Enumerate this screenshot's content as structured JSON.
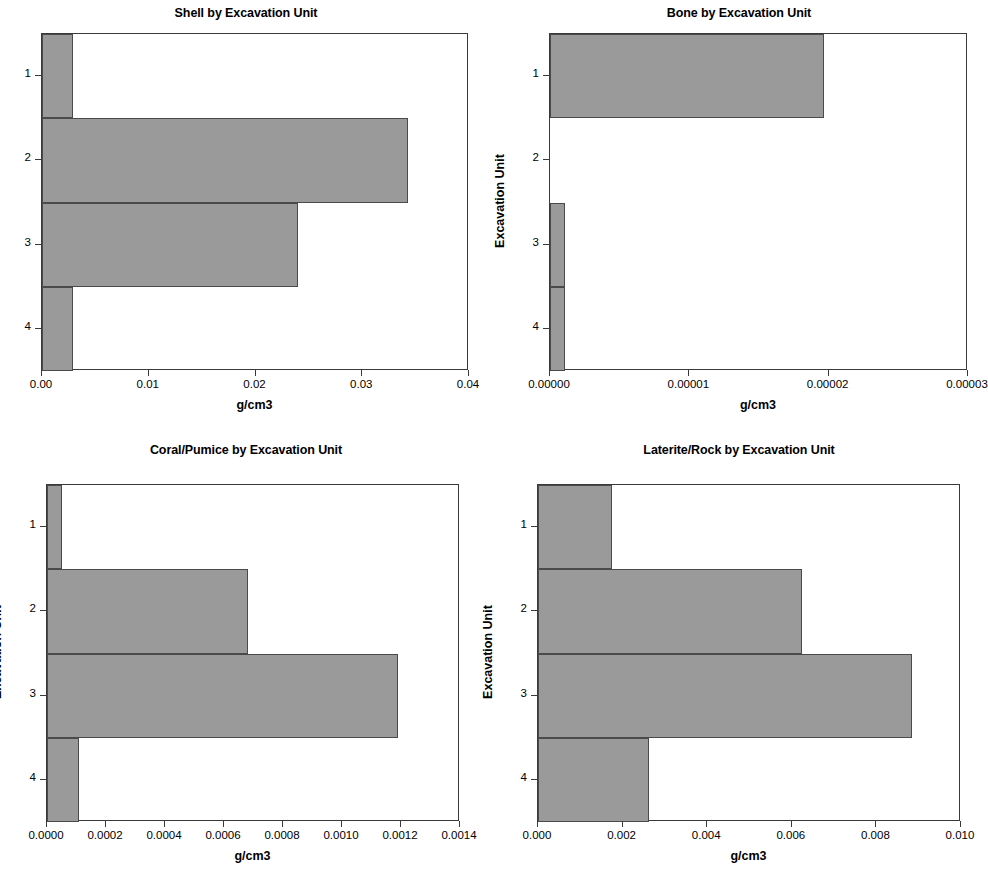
{
  "figure": {
    "background_color": "#ffffff",
    "bar_fill_color": "#9a9a9a",
    "bar_edge_color": "#4a4a4a",
    "axis_color": "#3a3a3a",
    "panel_count": 4
  },
  "chart_data": [
    {
      "type": "bar",
      "orientation": "horizontal",
      "title": "Shell by Excavation Unit",
      "xlabel": "g/cm3",
      "ylabel": "Excavation Unit",
      "categories": [
        "1",
        "2",
        "3",
        "4"
      ],
      "values": [
        0.0029,
        0.0343,
        0.024,
        0.0029
      ],
      "xlim": [
        0.0,
        0.04
      ],
      "xticks": [
        0.0,
        0.01,
        0.02,
        0.03,
        0.04
      ],
      "xticklabels": [
        "0.00",
        "0.01",
        "0.02",
        "0.03",
        "0.04"
      ],
      "grid": false,
      "legend": false
    },
    {
      "type": "bar",
      "orientation": "horizontal",
      "title": "Bone by Excavation Unit",
      "xlabel": "g/cm3",
      "ylabel": "Excavation Unit",
      "categories": [
        "1",
        "2",
        "3",
        "4"
      ],
      "values": [
        1.965e-05,
        0.0,
        1.05e-06,
        1.05e-06
      ],
      "xlim": [
        0.0,
        3e-05
      ],
      "xticks": [
        0.0,
        1e-05,
        2e-05,
        3e-05
      ],
      "xticklabels": [
        "0.00000",
        "0.00001",
        "0.00002",
        "0.00003"
      ],
      "grid": false,
      "legend": false
    },
    {
      "type": "bar",
      "orientation": "horizontal",
      "title": "Coral/Pumice by Excavation Unit",
      "xlabel": "g/cm3",
      "ylabel": "Excavation Unit",
      "categories": [
        "1",
        "2",
        "3",
        "4"
      ],
      "values": [
        5e-05,
        0.00068,
        0.00119,
        0.00011
      ],
      "xlim": [
        0.0,
        0.0014
      ],
      "xticks": [
        0.0,
        0.0002,
        0.0004,
        0.0006,
        0.0008,
        0.001,
        0.0012,
        0.0014
      ],
      "xticklabels": [
        "0.0000",
        "0.0002",
        "0.0004",
        "0.0006",
        "0.0008",
        "0.0010",
        "0.0012",
        "0.0014"
      ],
      "grid": false,
      "legend": false
    },
    {
      "type": "bar",
      "orientation": "horizontal",
      "title": "Laterite/Rock by Excavation Unit",
      "xlabel": "g/cm3",
      "ylabel": "Excavation Unit",
      "categories": [
        "1",
        "2",
        "3",
        "4"
      ],
      "values": [
        0.00175,
        0.00624,
        0.00885,
        0.00263
      ],
      "xlim": [
        0.0,
        0.01
      ],
      "xticks": [
        0.0,
        0.002,
        0.004,
        0.006,
        0.008,
        0.01
      ],
      "xticklabels": [
        "0.000",
        "0.002",
        "0.004",
        "0.006",
        "0.008",
        "0.010"
      ],
      "grid": false,
      "legend": false
    }
  ]
}
